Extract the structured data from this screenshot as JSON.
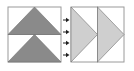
{
  "diagram": {
    "colors": {
      "background": "#ffffff",
      "frame_stroke": "#9a9a9a",
      "dark_triangle_fill": "#8a8a8a",
      "light_triangle_fill": "#cfcfcf",
      "triangle_edge": "#6e6e6e",
      "arrow": "#222222"
    },
    "left_panel": {
      "shape": "square split horizontally",
      "triangles": [
        {
          "id": "top",
          "direction": "up",
          "fill": "dark"
        },
        {
          "id": "bottom",
          "direction": "up",
          "fill": "dark"
        }
      ]
    },
    "arrows": {
      "count": 4,
      "direction": "right"
    },
    "right_panel": {
      "shape": "two tall rectangles side by side",
      "triangles": [
        {
          "id": "left",
          "direction": "right",
          "fill": "light"
        },
        {
          "id": "right",
          "direction": "right",
          "fill": "light"
        }
      ]
    }
  }
}
